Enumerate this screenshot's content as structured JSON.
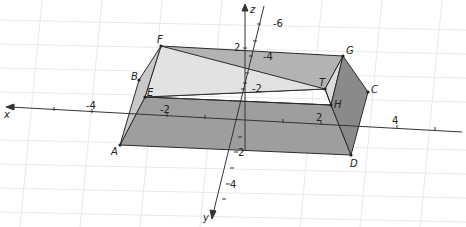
{
  "view": {
    "type": "3D graphics view",
    "background": "#ffffff",
    "grid_color": "#e6e6e6"
  },
  "axes": {
    "x": {
      "label": "x",
      "ticks": [
        "-4",
        "-2",
        "2",
        "4"
      ]
    },
    "y": {
      "label": "y",
      "ticks": [
        "2",
        "4"
      ]
    },
    "z": {
      "label": "z",
      "ticks": [
        "2"
      ]
    },
    "back_y_ticks": [
      "-2",
      "-4",
      "-6"
    ]
  },
  "points": {
    "A": "A",
    "B": "B",
    "C": "C",
    "D": "D",
    "E": "E",
    "F": "F",
    "G": "G",
    "H": "H",
    "T": "T"
  },
  "colors": {
    "face_dark": "#8c8c8c",
    "face_mid": "#a8a8a8",
    "face_light": "#d9d9d9",
    "edge": "#2b2b2b",
    "axis": "#333333"
  }
}
